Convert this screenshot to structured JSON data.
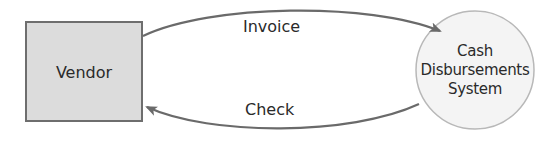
{
  "diagram": {
    "nodes": [
      {
        "id": "vendor",
        "label": "Vendor",
        "shape": "rectangle",
        "fill": "#dcdcdc",
        "stroke": "#6e6e6e"
      },
      {
        "id": "cash_disbursements_system",
        "label_lines": [
          "Cash",
          "Disbursements",
          "System"
        ],
        "shape": "circle",
        "fill": "#f2f2f2",
        "stroke": "#b5b5b5"
      }
    ],
    "edges": [
      {
        "from": "vendor",
        "to": "cash_disbursements_system",
        "label": "Invoice"
      },
      {
        "from": "cash_disbursements_system",
        "to": "vendor",
        "label": "Check"
      }
    ]
  },
  "colors": {
    "arrow": "#6a6a6a",
    "text": "#2a2a2a"
  }
}
